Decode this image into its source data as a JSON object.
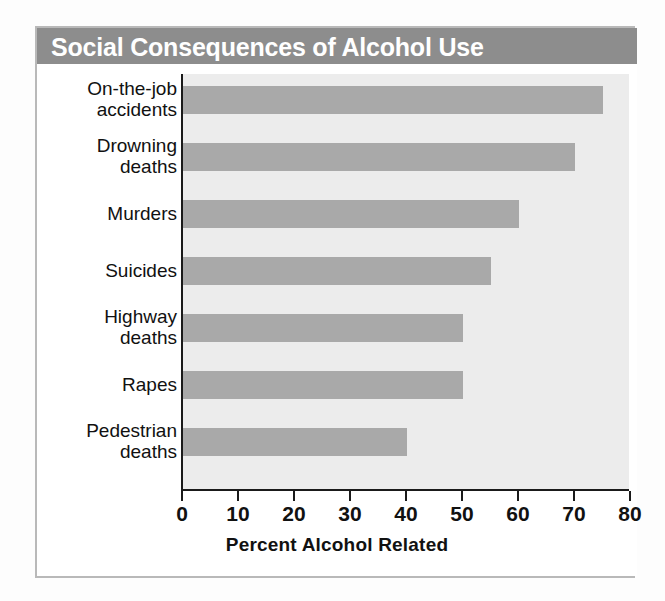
{
  "chart_data": {
    "type": "bar",
    "orientation": "horizontal",
    "title": "Social Consequences of Alcohol Use",
    "xlabel": "Percent Alcohol Related",
    "ylabel": "",
    "categories": [
      "On-the-job accidents",
      "Drowning deaths",
      "Murders",
      "Suicides",
      "Highway deaths",
      "Rapes",
      "Pedestrian deaths"
    ],
    "category_lines": [
      [
        "On-the-job",
        "accidents"
      ],
      [
        "Drowning",
        "deaths"
      ],
      [
        "Murders"
      ],
      [
        "Suicides"
      ],
      [
        "Highway",
        "deaths"
      ],
      [
        "Rapes"
      ],
      [
        "Pedestrian",
        "deaths"
      ]
    ],
    "values": [
      75,
      70,
      60,
      55,
      50,
      50,
      40
    ],
    "xlim": [
      0,
      80
    ],
    "xticks": [
      0,
      10,
      20,
      30,
      40,
      50,
      60,
      70,
      80
    ],
    "xtick_labels": [
      "0",
      "10",
      "20",
      "30",
      "40",
      "50",
      "60",
      "70",
      "80"
    ],
    "grid": false,
    "legend": null,
    "bar_color": "#a9a9a9",
    "plot_background": "#ececec",
    "title_bar_color": "#8d8d8d",
    "title_text_color": "#ffffff",
    "axis_color": "#1a1a1a"
  }
}
